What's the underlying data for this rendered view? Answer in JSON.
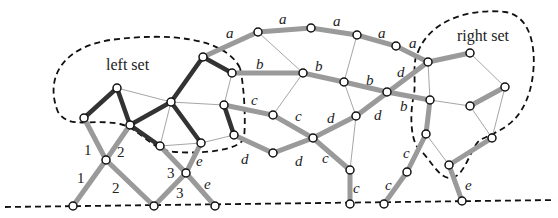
{
  "diagram": {
    "regions": {
      "left": "left set",
      "right": "right set"
    },
    "edge_labels": {
      "a": [
        "a",
        "a",
        "a",
        "a",
        "a"
      ],
      "b": [
        "b",
        "b",
        "b",
        "b"
      ],
      "c": [
        "c",
        "c",
        "c",
        "c",
        "c",
        "c",
        "c"
      ],
      "d": [
        "d",
        "d",
        "d",
        "d",
        "d",
        "d"
      ],
      "e": [
        "e",
        "e",
        "e",
        "e"
      ],
      "numbers": [
        "1",
        "1",
        "2",
        "2",
        "3",
        "3"
      ]
    },
    "colors": {
      "thick_dark": "#333333",
      "thick_grey": "#9a9a9a",
      "thin": "#a6a6a6",
      "dashed": "#111111"
    }
  }
}
